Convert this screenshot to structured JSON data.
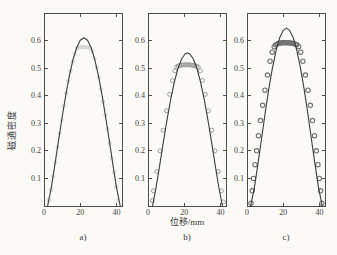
{
  "canvas": {
    "width": 337,
    "height": 255,
    "background": "#fbfaf6"
  },
  "axis": {
    "line_color": "#4c4c4c",
    "text_color": "#3f3f3f",
    "tick_font_size": 8,
    "tick_len": 3.5,
    "grid": false,
    "legend": "none"
  },
  "labels": {
    "ylabel": "磁通密度",
    "xlabel": "位移/mm"
  },
  "chart_data": [
    {
      "name": "a",
      "caption": "a)",
      "type": "line+scatter",
      "title": "",
      "xlabel": "位移/mm",
      "ylabel": "磁通密度",
      "xlim": [
        0,
        43
      ],
      "ylim": [
        0,
        0.7
      ],
      "x_ticks": [
        0,
        20,
        40
      ],
      "y_ticks": [
        0.1,
        0.2,
        0.3,
        0.4,
        0.5,
        0.6
      ],
      "line": {
        "color": "#3d3d3d",
        "x": [
          2,
          4,
          6,
          8,
          10,
          12,
          14,
          16,
          18,
          20,
          22,
          24,
          26,
          28,
          30,
          32,
          34,
          36,
          38,
          40,
          42
        ],
        "y": [
          0,
          0.066,
          0.149,
          0.237,
          0.322,
          0.402,
          0.473,
          0.531,
          0.574,
          0.601,
          0.61,
          0.601,
          0.574,
          0.531,
          0.473,
          0.402,
          0.322,
          0.237,
          0.149,
          0.066,
          0
        ]
      },
      "markers": {
        "color": "#c7c7c7",
        "radius": 1.6,
        "stroke_width": 0.9,
        "x": [
          2.6,
          3.8,
          5,
          6.2,
          7.4,
          8.6,
          9.8,
          11,
          12.2,
          13.4,
          14.6,
          15.8,
          17,
          18.2,
          19.4,
          20.6,
          21.8,
          23,
          24.2,
          25.4,
          26.6,
          27.8,
          29,
          30.2,
          31.4,
          32.6,
          33.8,
          35,
          36.2,
          37.4,
          38.6,
          39.8,
          41
        ],
        "y": [
          0.02,
          0.059,
          0.108,
          0.158,
          0.214,
          0.263,
          0.313,
          0.362,
          0.409,
          0.452,
          0.49,
          0.525,
          0.553,
          0.572,
          0.575,
          0.576,
          0.577,
          0.576,
          0.575,
          0.574,
          0.561,
          0.535,
          0.502,
          0.466,
          0.423,
          0.378,
          0.33,
          0.28,
          0.228,
          0.175,
          0.122,
          0.07,
          0.021
        ]
      }
    },
    {
      "name": "b",
      "caption": "b)",
      "type": "line+scatter",
      "title": "",
      "xlabel": "位移/mm",
      "ylabel": "磁通密度",
      "xlim": [
        0,
        43
      ],
      "ylim": [
        0,
        0.7
      ],
      "x_ticks": [
        0,
        20,
        40
      ],
      "y_ticks": [
        0.1,
        0.2,
        0.3,
        0.4,
        0.5,
        0.6
      ],
      "line": {
        "color": "#3d3d3d",
        "x": [
          2.5,
          4.5,
          6.5,
          8.5,
          10.5,
          12.5,
          14.5,
          16.5,
          18.5,
          20.5,
          21.75,
          23,
          25,
          27,
          29,
          31,
          33,
          35,
          37,
          39,
          41
        ],
        "y": [
          0,
          0.069,
          0.15,
          0.233,
          0.313,
          0.386,
          0.448,
          0.498,
          0.533,
          0.552,
          0.555,
          0.552,
          0.533,
          0.498,
          0.448,
          0.386,
          0.313,
          0.233,
          0.15,
          0.069,
          0
        ]
      },
      "markers": {
        "color": "#9c9c9c",
        "radius": 2.0,
        "stroke_width": 1.0,
        "x": [
          2.4,
          3,
          4.8,
          6.6,
          8.4,
          10.2,
          11.9,
          13.5,
          14.8,
          15.8,
          16.7,
          17.6,
          18.5,
          19.4,
          20.3,
          21.2,
          22.1,
          23,
          23.9,
          24.8,
          25.7,
          26.7,
          27.7,
          28.8,
          30,
          31.6,
          33.3,
          35.1,
          36.9,
          38.7,
          40.5,
          41.6
        ],
        "y": [
          0.02,
          0.055,
          0.125,
          0.2,
          0.275,
          0.345,
          0.405,
          0.455,
          0.49,
          0.505,
          0.508,
          0.51,
          0.511,
          0.512,
          0.512,
          0.512,
          0.512,
          0.512,
          0.511,
          0.51,
          0.509,
          0.507,
          0.504,
          0.49,
          0.455,
          0.405,
          0.345,
          0.275,
          0.2,
          0.125,
          0.055,
          0.015
        ]
      }
    },
    {
      "name": "c",
      "caption": "c)",
      "type": "line+scatter",
      "title": "",
      "xlabel": "位移/mm",
      "ylabel": "磁通密度",
      "xlim": [
        0,
        43
      ],
      "ylim": [
        0,
        0.7
      ],
      "x_ticks": [
        0,
        20,
        40
      ],
      "y_ticks": [
        0.1,
        0.2,
        0.3,
        0.4,
        0.5,
        0.6
      ],
      "line": {
        "color": "#3d3d3d",
        "x": [
          2,
          4,
          6,
          8,
          10,
          12,
          14,
          16,
          18,
          20,
          21.75,
          23.5,
          25.5,
          27.5,
          29.5,
          31.5,
          33.5,
          35.5,
          37.5,
          39.5,
          41.5
        ],
        "y": [
          0,
          0.064,
          0.151,
          0.243,
          0.337,
          0.424,
          0.5,
          0.563,
          0.61,
          0.637,
          0.645,
          0.637,
          0.61,
          0.563,
          0.5,
          0.424,
          0.337,
          0.243,
          0.151,
          0.064,
          0
        ]
      },
      "markers": {
        "color": "#707070",
        "radius": 2.2,
        "stroke_width": 1.1,
        "x": [
          2.2,
          2.9,
          3.6,
          4.4,
          5.3,
          6.3,
          7.4,
          8.6,
          9.9,
          11.3,
          12.7,
          13.9,
          15,
          15.8,
          16.7,
          17.6,
          18.5,
          19.4,
          20.3,
          21.2,
          22.1,
          23,
          23.9,
          24.8,
          25.7,
          26.6,
          27.5,
          28.5,
          29.6,
          30.8,
          32.2,
          33.6,
          34.9,
          36.1,
          37.2,
          38.2,
          39.1,
          39.9,
          40.6,
          41.3
        ],
        "y": [
          0.01,
          0.055,
          0.1,
          0.15,
          0.2,
          0.255,
          0.31,
          0.365,
          0.42,
          0.475,
          0.525,
          0.558,
          0.578,
          0.585,
          0.588,
          0.59,
          0.591,
          0.592,
          0.592,
          0.592,
          0.592,
          0.592,
          0.591,
          0.59,
          0.589,
          0.587,
          0.585,
          0.578,
          0.558,
          0.525,
          0.475,
          0.42,
          0.365,
          0.31,
          0.255,
          0.2,
          0.15,
          0.1,
          0.055,
          0.01
        ]
      }
    }
  ]
}
